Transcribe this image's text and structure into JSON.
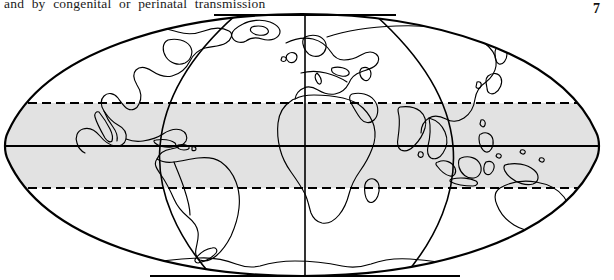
{
  "page": {
    "body_text_line": "and by congenital or perinatal transmission",
    "page_number": "7"
  },
  "figure": {
    "name": "world-map-tropical-belt",
    "projection": "elliptical (Mollweide / Aitoff style) world map",
    "ink_color": "#000000",
    "background_color": "#ffffff",
    "shaded_band_color": "#e2e2e2",
    "shaded_band_description": "tropical belt between Tropic of Cancer and Tropic of Capricorn",
    "lines": {
      "equator_label": "Equator (solid)",
      "tropic_of_cancer_label": "Tropic of Cancer (dashed)",
      "tropic_of_capricorn_label": "Tropic of Capricorn (dashed)"
    },
    "graticule": {
      "central_meridian_x": 305,
      "meridian_left_x": 160,
      "meridian_right_x": 453,
      "equator_y": 136,
      "tropic_cancer_y": 93,
      "tropic_capricorn_y": 178
    },
    "ellipse": {
      "cx": 302,
      "cy": 136,
      "rx": 295,
      "ry": 132
    }
  }
}
